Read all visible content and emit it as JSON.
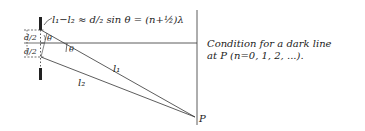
{
  "diagram": {
    "equation": "l₁−l₂ ≈ d/₂ sin θ = (n+½)λ",
    "labels": {
      "half_d_top": "d/2",
      "half_d_bottom": "d/2",
      "theta_slit": "θ",
      "theta_axis": "θ",
      "ray1": "l₁",
      "ray2": "l₂",
      "point": "P"
    },
    "caption": {
      "line1": "Condition for a dark line",
      "line2": "at P (n=0, 1, 2, ...)."
    },
    "colors": {
      "ink": "#222222",
      "background": "#ffffff"
    }
  }
}
